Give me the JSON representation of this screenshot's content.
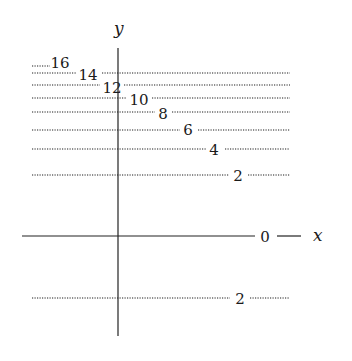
{
  "axes": {
    "x_label": "x",
    "y_label": "y"
  },
  "levels": [
    {
      "label": "16",
      "y": 66,
      "lx": 60,
      "ly": 68,
      "segments": [
        [
          32,
          50
        ]
      ]
    },
    {
      "label": "14",
      "y": 73,
      "lx": 88,
      "ly": 80,
      "segments": [
        [
          32,
          76
        ],
        [
          102,
          290
        ]
      ]
    },
    {
      "label": "12",
      "y": 85,
      "lx": 112,
      "ly": 93,
      "segments": [
        [
          32,
          100
        ],
        [
          124,
          290
        ]
      ]
    },
    {
      "label": "10",
      "y": 98,
      "lx": 139,
      "ly": 105,
      "segments": [
        [
          32,
          126
        ],
        [
          152,
          290
        ]
      ]
    },
    {
      "label": "8",
      "y": 112,
      "lx": 163,
      "ly": 119,
      "segments": [
        [
          32,
          155
        ],
        [
          172,
          290
        ]
      ]
    },
    {
      "label": "6",
      "y": 130,
      "lx": 188,
      "ly": 135,
      "segments": [
        [
          32,
          180
        ],
        [
          198,
          290
        ]
      ]
    },
    {
      "label": "4",
      "y": 149,
      "lx": 214,
      "ly": 155,
      "segments": [
        [
          32,
          206
        ],
        [
          225,
          290
        ]
      ]
    },
    {
      "label": "2",
      "y": 175,
      "lx": 238,
      "ly": 181,
      "segments": [
        [
          32,
          229
        ],
        [
          248,
          290
        ]
      ]
    },
    {
      "label": "0",
      "y": 236,
      "lx": 265,
      "ly": 242,
      "segments": []
    },
    {
      "label": "2",
      "y": 298,
      "lx": 240,
      "ly": 304,
      "segments": [
        [
          32,
          230
        ],
        [
          250,
          290
        ]
      ]
    }
  ]
}
